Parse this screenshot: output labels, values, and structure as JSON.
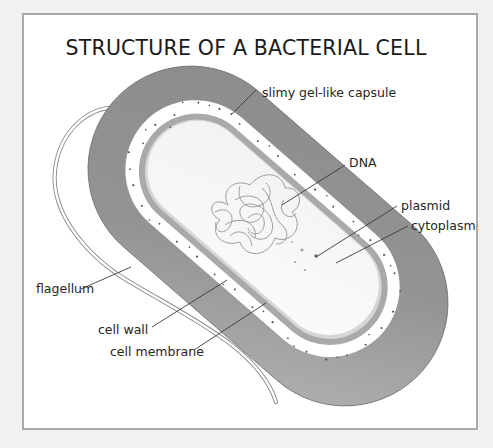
{
  "title": "STRUCTURE OF A BACTERIAL CELL",
  "labels": {
    "capsule": "slimy gel-like capsule",
    "dna": "DNA",
    "plasmid": "plasmid",
    "cytoplasm": "cytoplasm",
    "flagellum": "flagellum",
    "cell_wall": "cell wall",
    "cell_membrane": "cell membrane"
  },
  "colors": {
    "capsule": "#8f8f8f",
    "cell_wall": "#ffffff",
    "cell_membrane": "#a8a8a8",
    "cytoplasm": "#f5f5f5",
    "dna": "#9a9a9a",
    "frame_border": "#a9a9a9",
    "page_background": "#f1f1f1"
  }
}
